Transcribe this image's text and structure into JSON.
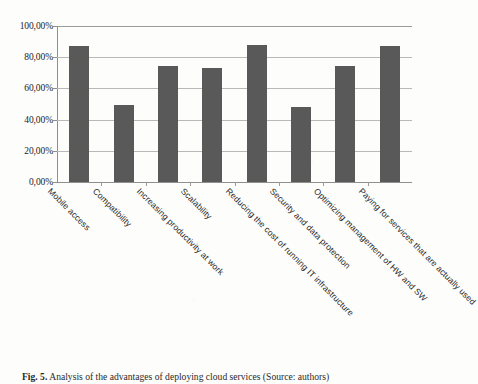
{
  "caption": {
    "figure_number": "Fig. 5.",
    "text": "Analysis of the advantages of deploying cloud services (Source: authors)"
  },
  "chart_data": {
    "type": "bar",
    "title": "",
    "xlabel": "",
    "ylabel": "",
    "ylim": [
      0,
      100
    ],
    "grid": true,
    "legend": "none",
    "orientation": "vertical",
    "bar_color": "#595959",
    "gridline_color": "#b9b9b9",
    "value_suffix": "%",
    "decimal_separator": ",",
    "categories": [
      "Mobile access",
      "Compatibility",
      "Increasing productivity at work",
      "Scalability",
      "Reducing the cost of running IT infrastructure",
      "Security and data protection",
      "Optimizing management of HW and SW",
      "Paying for services that are actually used"
    ],
    "values": [
      87.0,
      49.5,
      74.5,
      73.0,
      88.0,
      48.0,
      74.5,
      87.0
    ],
    "ytick_values": [
      0,
      20,
      40,
      60,
      80,
      100
    ],
    "ytick_labels": [
      "0,00%",
      "20,00%",
      "40,00%",
      "60,00%",
      "80,00%",
      "100,00%"
    ]
  }
}
